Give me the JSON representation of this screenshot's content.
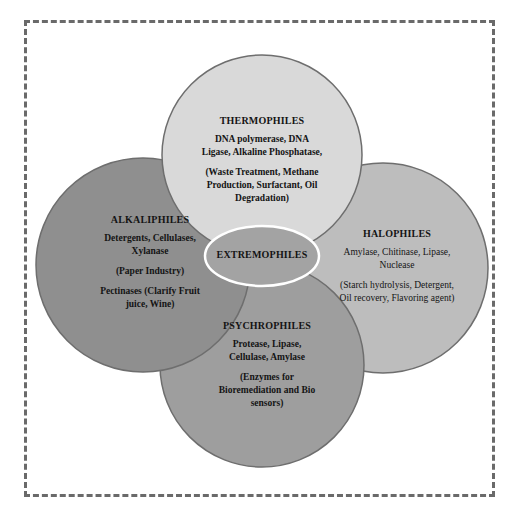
{
  "diagram": {
    "center": {
      "label": "EXTREMOPHILES"
    },
    "circles": [
      {
        "id": "thermophiles",
        "title": "THERMOPHILES",
        "enzymes": [
          "DNA polymerase, DNA",
          "Ligase, Alkaline Phosphatase,"
        ],
        "applications": [
          "(Waste Treatment, Methane",
          "Production, Surfactant, Oil",
          "Degradation)"
        ],
        "fill": "#d9d9d9"
      },
      {
        "id": "alkaliphiles",
        "title": "ALKALIPHILES",
        "enzymes": [
          "Detergents, Cellulases,",
          "Xylanase"
        ],
        "applications": [
          "(Paper Industry)"
        ],
        "extra": [
          "Pectinases (Clarify Fruit",
          "juice, Wine)"
        ],
        "fill": "#8f8f8f"
      },
      {
        "id": "halophiles",
        "title": "HALOPHILES",
        "enzymes": [
          "Amylase, Chitinase, Lipase,",
          "Nuclease"
        ],
        "applications": [
          "(Starch hydrolysis, Detergent,",
          "Oil recovery, Flavoring agent)"
        ],
        "fill": "#bdbdbd"
      },
      {
        "id": "psychrophiles",
        "title": "PSYCHROPHILES",
        "enzymes": [
          "Protease, Lipase,",
          "Cellulase, Amylase"
        ],
        "applications": [
          "(Enzymes for",
          "Bioremediation and Bio",
          "sensors)"
        ],
        "fill": "#9e9e9e"
      }
    ],
    "colors": {
      "border_dash": "#6a6a6a",
      "circle_stroke": "#6e6e6e",
      "ellipse_fill": "#a3a3a3",
      "ellipse_stroke": "#ffffff",
      "text": "#141414"
    }
  }
}
